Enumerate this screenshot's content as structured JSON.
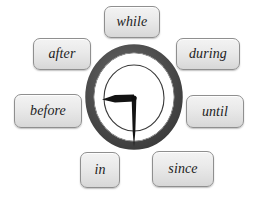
{
  "image": {
    "title": "Time prepositions around a clock",
    "background_color": "#ffffff",
    "width": 262,
    "height": 198
  },
  "chips": {
    "while": {
      "label": "while",
      "position": "top"
    },
    "after": {
      "label": "after",
      "position": "top-left"
    },
    "during": {
      "label": "during",
      "position": "top-right"
    },
    "before": {
      "label": "before",
      "position": "left"
    },
    "until": {
      "label": "until",
      "position": "right"
    },
    "in": {
      "label": "in",
      "position": "bottom-left"
    },
    "since": {
      "label": "since",
      "position": "bottom-right"
    }
  },
  "chip_style": {
    "fill_color": "#e8e8e8",
    "border_color": "#8f8f8f",
    "text_color": "#1c1c1c"
  },
  "clock": {
    "name": "analog-clock",
    "ring_color": "#4b4b4b",
    "face_color": "#ffffff",
    "dial_outline_color": "#3a3a3a",
    "hand_color": "#111111",
    "minute_hand_direction": "left",
    "hour_hand_direction": "down",
    "has_numerals": false,
    "has_tick_marks": false
  }
}
